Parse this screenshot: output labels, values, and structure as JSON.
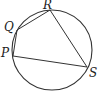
{
  "figure": {
    "type": "cyclic-quadrilateral",
    "circle": {
      "cx": 52,
      "cy": 50,
      "r": 40
    },
    "points": [
      {
        "name": "R",
        "x": 50,
        "y": 10,
        "label_x": 43,
        "label_y": 9
      },
      {
        "name": "Q",
        "x": 17,
        "y": 30,
        "label_x": 4,
        "label_y": 31
      },
      {
        "name": "P",
        "x": 13,
        "y": 56,
        "label_x": 1,
        "label_y": 57
      },
      {
        "name": "S",
        "x": 87,
        "y": 67,
        "label_x": 89,
        "label_y": 77
      }
    ],
    "segments": [
      [
        "P",
        "Q"
      ],
      [
        "Q",
        "R"
      ],
      [
        "R",
        "S"
      ],
      [
        "S",
        "P"
      ]
    ],
    "stroke_color": "#333333"
  }
}
